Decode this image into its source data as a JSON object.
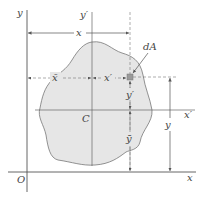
{
  "diagram": {
    "type": "centroid-parallel-axis",
    "colors": {
      "line": "#555555",
      "region_fill": "#e6e6e6",
      "region_stroke": "#777777",
      "element_fill": "#9a9a9a",
      "background": "#ffffff"
    },
    "labels": {
      "y_axis": "y",
      "y_prime_axis": "y′",
      "x_top_distance": "x",
      "x_bar": "x̄",
      "x_prime_distance": "x′",
      "dA": "dA",
      "centroid": "C",
      "y_prime_distance": "y′",
      "y_bar": "ȳ",
      "y_distance": "y",
      "x_prime_axis": "x′",
      "origin": "O",
      "x_axis": "x"
    }
  }
}
